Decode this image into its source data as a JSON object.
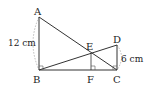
{
  "diagram": {
    "points": {
      "A": {
        "label": "A",
        "x": 39,
        "y": 17
      },
      "B": {
        "label": "B",
        "x": 39,
        "y": 70
      },
      "C": {
        "label": "C",
        "x": 117,
        "y": 70
      },
      "D": {
        "label": "D",
        "x": 117,
        "y": 45
      },
      "E": {
        "label": "E",
        "x": 91,
        "y": 53
      },
      "F": {
        "label": "F",
        "x": 91,
        "y": 70
      }
    },
    "segments": [
      "AB",
      "BC",
      "CD",
      "AC",
      "BD",
      "EF"
    ],
    "right_angles": [
      "B",
      "F",
      "C"
    ],
    "measurements": {
      "AB": "12 cm",
      "CD": "6 cm"
    }
  }
}
